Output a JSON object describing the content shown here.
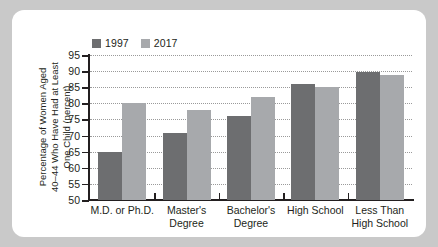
{
  "chart_data": {
    "type": "bar",
    "title": "",
    "subtitle": "",
    "xlabel": "",
    "ylabel": "Percentage of Women Aged 40–44 Who Have Had at Least One Child (percent)",
    "ylabel_lines": [
      "Percentage of Women Aged",
      "40–44 Who Have Had at Least",
      "One Child (percent)"
    ],
    "categories": [
      "M.D. or Ph.D.",
      "Master's Degree",
      "Bachelor's Degree",
      "High School",
      "Less Than High School"
    ],
    "category_lines": [
      [
        "M.D. or Ph.D."
      ],
      [
        "Master's",
        "Degree"
      ],
      [
        "Bachelor's",
        "Degree"
      ],
      [
        "High School"
      ],
      [
        "Less Than",
        "High School"
      ]
    ],
    "series": [
      {
        "name": "1997",
        "color": "#6d6e70",
        "values": [
          65,
          70.7,
          76,
          86,
          89.7
        ]
      },
      {
        "name": "2017",
        "color": "#a7a9ac",
        "values": [
          80,
          78,
          82,
          85,
          88.7
        ]
      }
    ],
    "ylim": [
      50,
      95
    ],
    "yticks": [
      50,
      55,
      60,
      65,
      70,
      75,
      80,
      85,
      90,
      95
    ],
    "ytick_labels": [
      "50",
      "55",
      "60",
      "65",
      "70",
      "75",
      "80",
      "85",
      "90",
      "95"
    ],
    "grid": true,
    "grid_style": "dotted",
    "legend_position": "top-left",
    "legend": [
      "1997",
      "2017"
    ]
  },
  "theme": {
    "page_background": "#c9c9c9",
    "card_background": "#ffffff",
    "text_color": "#231f20",
    "axis_color": "#231f20",
    "grid_color": "#9a9a9a"
  }
}
